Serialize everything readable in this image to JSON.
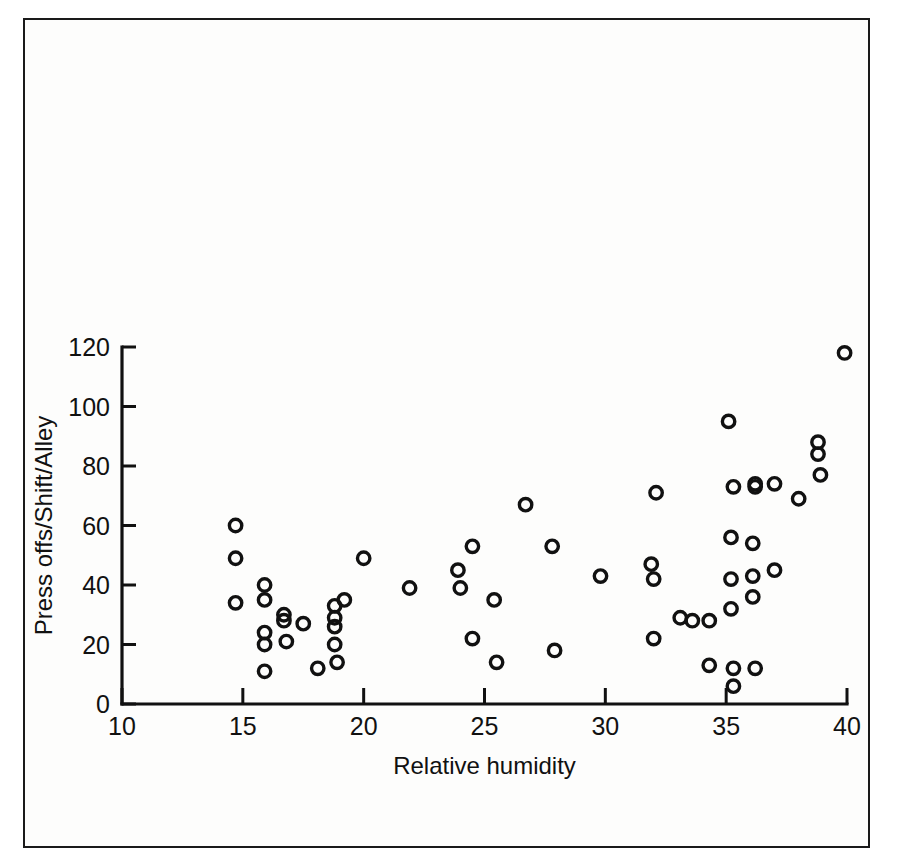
{
  "figure": {
    "background_color": "#fdfdfc",
    "frame_color": "#1a1a1a",
    "marker_color": "#111111"
  },
  "chart_data": {
    "type": "scatter",
    "title": "",
    "xlabel": "Relative humidity",
    "ylabel": "Press offs/Shift/Alley",
    "xlim": [
      10,
      40
    ],
    "ylim": [
      0,
      120
    ],
    "xticks": [
      10,
      15,
      20,
      25,
      30,
      35,
      40
    ],
    "yticks": [
      0,
      20,
      40,
      60,
      80,
      100,
      120
    ],
    "xtick_labels": [
      "10",
      "15",
      "20",
      "25",
      "30",
      "35",
      "40"
    ],
    "ytick_labels": [
      "0",
      "20",
      "40",
      "60",
      "80",
      "100",
      "120"
    ],
    "grid": false,
    "legend": null,
    "marker_style": "open-circle",
    "series": [
      {
        "name": "Press offs per shift per alley",
        "points": [
          [
            14.7,
            60
          ],
          [
            14.7,
            49
          ],
          [
            14.7,
            34
          ],
          [
            15.9,
            40
          ],
          [
            15.9,
            35
          ],
          [
            15.9,
            24
          ],
          [
            15.9,
            20
          ],
          [
            15.9,
            11
          ],
          [
            16.7,
            30
          ],
          [
            16.7,
            28
          ],
          [
            16.8,
            21
          ],
          [
            17.5,
            27
          ],
          [
            18.1,
            12
          ],
          [
            18.8,
            33
          ],
          [
            18.8,
            29
          ],
          [
            18.8,
            26
          ],
          [
            18.8,
            20
          ],
          [
            18.9,
            14
          ],
          [
            19.2,
            35
          ],
          [
            20.0,
            49
          ],
          [
            21.9,
            39
          ],
          [
            23.9,
            45
          ],
          [
            24.0,
            39
          ],
          [
            24.5,
            53
          ],
          [
            24.5,
            22
          ],
          [
            25.4,
            35
          ],
          [
            25.5,
            14
          ],
          [
            26.7,
            67
          ],
          [
            27.8,
            53
          ],
          [
            27.9,
            18
          ],
          [
            29.8,
            43
          ],
          [
            31.9,
            47
          ],
          [
            32.0,
            42
          ],
          [
            32.0,
            22
          ],
          [
            32.1,
            71
          ],
          [
            33.1,
            29
          ],
          [
            33.6,
            28
          ],
          [
            34.3,
            28
          ],
          [
            34.3,
            13
          ],
          [
            35.1,
            95
          ],
          [
            35.2,
            56
          ],
          [
            35.2,
            42
          ],
          [
            35.2,
            32
          ],
          [
            35.3,
            73
          ],
          [
            35.3,
            12
          ],
          [
            35.3,
            6
          ],
          [
            36.1,
            54
          ],
          [
            36.1,
            43
          ],
          [
            36.1,
            36
          ],
          [
            36.2,
            74
          ],
          [
            36.2,
            73
          ],
          [
            36.2,
            12
          ],
          [
            37.0,
            74
          ],
          [
            37.0,
            45
          ],
          [
            38.0,
            69
          ],
          [
            38.8,
            88
          ],
          [
            38.8,
            84
          ],
          [
            38.9,
            77
          ],
          [
            39.9,
            118
          ]
        ]
      }
    ]
  },
  "axes": {
    "x_axis_name": "Relative humidity",
    "y_axis_name": "Press offs/Shift/Alley"
  }
}
